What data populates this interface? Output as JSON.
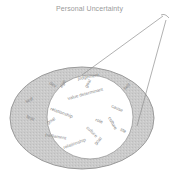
{
  "title": "Personal Uncertainty",
  "colors": {
    "outer_ring": "#c9c9c9",
    "outer_ring_stroke": "#9a9a9a",
    "inner_circle": "#ffffff",
    "text": "#8a8a8a",
    "lines": "#8f8f8f"
  },
  "outer_ring_words": [
    {
      "text": "self",
      "x": 26,
      "y": 103,
      "rot": -20
    },
    {
      "text": "fear",
      "x": 26,
      "y": 118,
      "rot": 20
    }
  ],
  "inner_words": [
    {
      "text": "dev",
      "x": 49,
      "y": 84,
      "rot": 30
    },
    {
      "text": "ego",
      "x": 62,
      "y": 88,
      "rot": -60
    },
    {
      "text": "judgement",
      "x": 78,
      "y": 80,
      "rot": -10
    },
    {
      "text": "goal",
      "x": 87,
      "y": 88,
      "rot": -60
    },
    {
      "text": "self",
      "x": 125,
      "y": 90,
      "rot": -40
    },
    {
      "text": "value determinant",
      "x": 68,
      "y": 100,
      "rot": -15
    },
    {
      "text": "relationship",
      "x": 50,
      "y": 110,
      "rot": 20
    },
    {
      "text": "cause",
      "x": 111,
      "y": 107,
      "rot": 25
    },
    {
      "text": "role",
      "x": 95,
      "y": 121,
      "rot": 20
    },
    {
      "text": "culture",
      "x": 108,
      "y": 118,
      "rot": 60
    },
    {
      "text": "goal",
      "x": 48,
      "y": 124,
      "rot": -30
    },
    {
      "text": "parliament",
      "x": 45,
      "y": 136,
      "rot": 10
    },
    {
      "text": "culture",
      "x": 86,
      "y": 128,
      "rot": 45
    },
    {
      "text": "relationship",
      "x": 64,
      "y": 149,
      "rot": -20
    },
    {
      "text": "goal",
      "x": 96,
      "y": 145,
      "rot": -45
    },
    {
      "text": "life",
      "x": 120,
      "y": 131,
      "rot": 20
    }
  ]
}
